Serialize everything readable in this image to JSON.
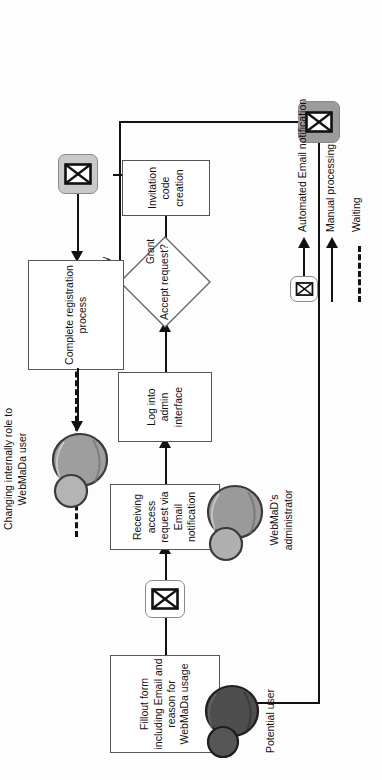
{
  "diagram": {
    "orientation": "rotated-90-ccw",
    "nodes": {
      "fillout_form": "Fillout form including Email and reason for WebMaDa usage",
      "receiving_request": "Receiving access request via Email notification",
      "log_into_admin": "Log into admin interface",
      "accept_request": "Accept request?",
      "invitation_code": "Invitation code creation",
      "complete_registration": "Complete registration process"
    },
    "edge_labels": {
      "grant": "Grant",
      "deny": "Deny"
    },
    "actors": {
      "potential_user": "Potential user",
      "webmada_administrator": "WebMaD's administrator"
    },
    "outcome_note": "Changing internally role to WebMaDa user",
    "legend": {
      "items": [
        {
          "label": "Automated Email notification",
          "icon": "envelope-arrow-icon"
        },
        {
          "label": "Manual processing",
          "icon": "solid-arrow-icon"
        },
        {
          "label": "Waiting",
          "icon": "dashed-line-icon"
        }
      ]
    },
    "colors": {
      "line": "#111111",
      "node_border": "#555555",
      "node_fill": "#ffffff",
      "envelope_plate_white": "#fefefe",
      "envelope_plate_light": "#c9c9c9",
      "envelope_plate_dark": "#9c9c9c",
      "avatar_user_dark": "#4a4a4a",
      "avatar_admin_mid": "#8f8f8f",
      "avatar_outcome_mid": "#9a9a9a"
    }
  }
}
